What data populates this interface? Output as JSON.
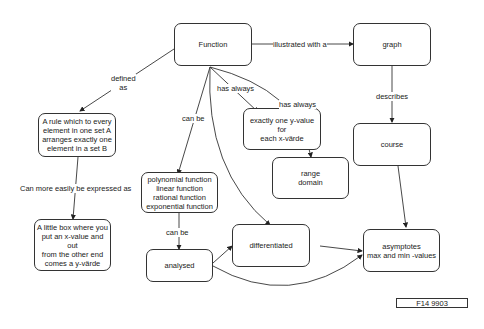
{
  "nodes": {
    "function": "Function",
    "graph": "graph",
    "rule": "A rule which to every\nelement  in one set A\narranges exactly one\nelement in a set B",
    "little_box": "A little box where you\nput an x-value and out\nfrom the other end\ncomes a y-värde",
    "exactly_one": "exactly one y-value for\neach x-värde",
    "range_domain": "range\ndomain",
    "course": "course",
    "types": "polynomial function\nlinear function\nrational function\nexponential function",
    "analysed": "analysed",
    "differentiated": "differentiated",
    "asymptotes": "asymptotes\nmax and min -values"
  },
  "labels": {
    "illustrated": "illustrated with a",
    "defined_as": "defined\nas",
    "has_always_1": "has always",
    "has_always_2": "has always",
    "can_be_1": "can be",
    "can_be_2": "can be",
    "describes": "describes",
    "expressed": "Can more easily be expressed as"
  },
  "reference": "F14 9903"
}
